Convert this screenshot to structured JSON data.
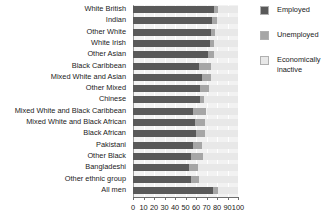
{
  "chart_data": {
    "type": "bar",
    "subtype": "horizontal-stacked-bar",
    "title": "",
    "xlabel": "",
    "ylabel": "",
    "xlim": [
      0,
      100
    ],
    "xticks": [
      0,
      10,
      20,
      30,
      40,
      50,
      60,
      70,
      80,
      90,
      100
    ],
    "xticklabels": [
      "0",
      "10",
      "20",
      "30",
      "40",
      "50",
      "60",
      "70",
      "80",
      "90",
      "100"
    ],
    "grid": true,
    "legend_position": "right",
    "categories": [
      "White British",
      "Indian",
      "Other White",
      "White Irish",
      "Other Asian",
      "Black Caribbean",
      "Mixed White and Asian",
      "Other Mixed",
      "Chinese",
      "Mixed White and Black Caribbean",
      "Mixed White and Black African",
      "Black African",
      "Pakistani",
      "Other Black",
      "Bangladeshi",
      "Other ethnic group",
      "All men"
    ],
    "series": [
      {
        "name": "Employed",
        "color": "#595959",
        "values": [
          77,
          75,
          74,
          73,
          71,
          63,
          66,
          64,
          64,
          57,
          59,
          60,
          57,
          55,
          53,
          55,
          76
        ]
      },
      {
        "name": "Unemployed",
        "color": "#a6a6a6",
        "values": [
          4,
          5,
          4,
          4,
          6,
          11,
          8,
          8,
          4,
          13,
          10,
          9,
          9,
          12,
          9,
          8,
          5
        ]
      },
      {
        "name": "Economically inactive",
        "color": "#e8e8e8",
        "values": [
          19,
          20,
          22,
          23,
          23,
          26,
          26,
          28,
          32,
          30,
          31,
          31,
          34,
          33,
          38,
          37,
          19
        ]
      }
    ]
  },
  "legend": {
    "items": [
      {
        "label": "Employed",
        "color": "#595959"
      },
      {
        "label": "Unemployed",
        "color": "#a6a6a6"
      },
      {
        "label": "Economically\ninactive",
        "color": "#e8e8e8"
      }
    ]
  }
}
